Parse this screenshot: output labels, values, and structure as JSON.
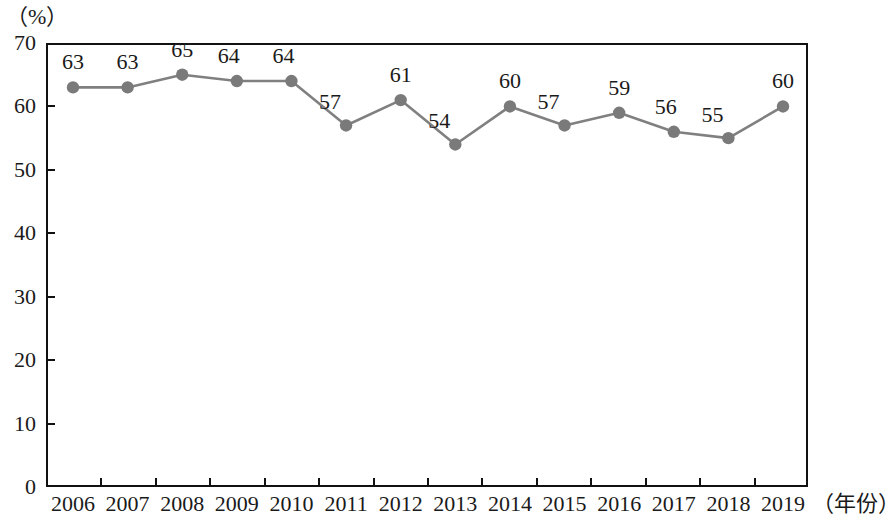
{
  "chart_data": {
    "type": "line",
    "title": "",
    "subtitle": "",
    "xlabel": "（年份）",
    "ylabel": "（%）",
    "categories": [
      "2006",
      "2007",
      "2008",
      "2009",
      "2010",
      "2011",
      "2012",
      "2013",
      "2014",
      "2015",
      "2016",
      "2017",
      "2018",
      "2019"
    ],
    "values": [
      63,
      63,
      65,
      64,
      64,
      57,
      61,
      54,
      60,
      57,
      59,
      56,
      55,
      60
    ],
    "point_labels": [
      "63",
      "63",
      "65",
      "64",
      "64",
      "57",
      "61",
      "54",
      "60",
      "57",
      "59",
      "56",
      "55",
      "60"
    ],
    "ylim": [
      0,
      70
    ],
    "ytick_labels": [
      "0",
      "10",
      "20",
      "30",
      "40",
      "50",
      "60",
      "70"
    ],
    "ytick_values": [
      0,
      10,
      20,
      30,
      40,
      50,
      60,
      70
    ],
    "grid": false,
    "legend": null,
    "legend_position": "none",
    "marker": "filled-circle",
    "colors": {
      "line": "#808080",
      "marker": "#7a7a7a",
      "axis": "#111111",
      "text": "#1a1a1a",
      "background": "#ffffff"
    }
  },
  "axes": {
    "y_unit_caption": "（%）",
    "x_unit_caption": "（年份）"
  }
}
